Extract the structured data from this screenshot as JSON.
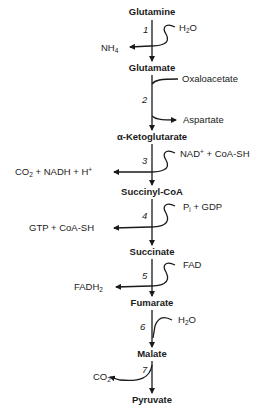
{
  "diagram": {
    "type": "metabolic-pathway",
    "metabolites": [
      {
        "id": "glutamine",
        "label": "Glutamine"
      },
      {
        "id": "glutamate",
        "label": "Glutamate"
      },
      {
        "id": "akg",
        "label": "α-Ketoglutarate"
      },
      {
        "id": "succinylcoa",
        "label": "Succinyl-CoA"
      },
      {
        "id": "succinate",
        "label": "Succinate"
      },
      {
        "id": "fumarate",
        "label": "Fumarate"
      },
      {
        "id": "malate",
        "label": "Malate"
      },
      {
        "id": "pyruvate",
        "label": "Pyruvate"
      }
    ],
    "steps": [
      {
        "number": "1",
        "inputs": {
          "base": "H",
          "sub": "2",
          "rest": "O"
        },
        "outputs": {
          "base": "NH",
          "sub": "4"
        }
      },
      {
        "number": "2",
        "inputs": "Oxaloacetate",
        "outputs": "Aspartate"
      },
      {
        "number": "3",
        "inputs": {
          "a": "NAD",
          "sup": "+",
          "b": " + CoA-SH"
        },
        "outputs": {
          "a": "CO",
          "sub": "2",
          "b": " + NADH + H",
          "sup": "+"
        }
      },
      {
        "number": "4",
        "inputs": {
          "a": "P",
          "sub": "i",
          "b": " + GDP"
        },
        "outputs": "GTP + CoA-SH"
      },
      {
        "number": "5",
        "inputs": "FAD",
        "outputs": {
          "a": "FADH",
          "sub": "2"
        }
      },
      {
        "number": "6",
        "inputs": {
          "base": "H",
          "sub": "2",
          "rest": "O"
        },
        "outputs": ""
      },
      {
        "number": "7",
        "inputs": "",
        "outputs": {
          "base": "CO",
          "sub": "2"
        }
      }
    ]
  }
}
